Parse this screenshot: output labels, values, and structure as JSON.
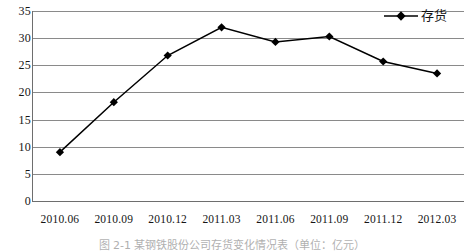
{
  "chart_data": {
    "type": "line",
    "title": "",
    "xlabel": "",
    "ylabel": "",
    "categories": [
      "2010.06",
      "2010.09",
      "2010.12",
      "2011.03",
      "2011.06",
      "2011.09",
      "2011.12",
      "2012.03"
    ],
    "series": [
      {
        "name": "存货",
        "values": [
          9.0,
          18.2,
          26.8,
          32.0,
          29.3,
          30.3,
          25.7,
          23.5
        ],
        "marker": "diamond",
        "color": "#000000"
      }
    ],
    "ylim": [
      0,
      35
    ],
    "ytick_step": 5,
    "yticks": [
      35,
      30,
      25,
      20,
      15,
      10,
      5,
      0
    ],
    "ytick_labels": [
      "35",
      "30",
      "25",
      "20",
      "15",
      "10",
      "5",
      "0"
    ],
    "grid": true,
    "grid_axis": "y",
    "legend_position": "top-right",
    "legend_entries": [
      "存货"
    ]
  },
  "legend": {
    "label": "存货",
    "marker_icon": "diamond-marker-icon"
  },
  "caption": {
    "text": "图 2-1  某钢铁股份公司存货变化情况表（单位：亿元）"
  },
  "colors": {
    "series": "#000000",
    "gridline": "#8a8a8a",
    "axis": "#6e6e6e",
    "text": "#151515",
    "background": "#ffffff"
  }
}
